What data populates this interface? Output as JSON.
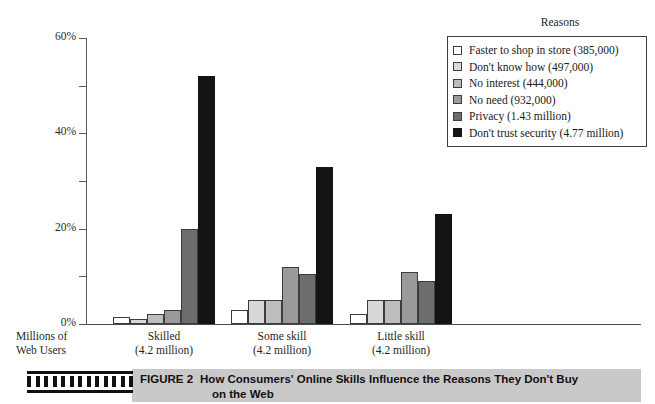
{
  "chart_data": {
    "type": "bar",
    "title": "How Consumers' Online Skills Influence the Reasons They Don't Buy on the Web",
    "xlabel": "Millions of Web Users",
    "ylabel": "",
    "ylim": [
      0,
      60
    ],
    "yticks": [
      "0%",
      "20%",
      "40%",
      "60%"
    ],
    "ytick_values": [
      0,
      20,
      40,
      60
    ],
    "minor_ticks": [
      10,
      30,
      50
    ],
    "grid": false,
    "legend_position": "top-right",
    "legend_title": "Reasons",
    "categories": [
      "Skilled",
      "Some skill",
      "Little skill"
    ],
    "category_sublabels": [
      "(4.2 million)",
      "(4.2 million)",
      "(4.2 million)"
    ],
    "series": [
      {
        "name": "Faster to shop in store (385,000)",
        "color": "#ffffff",
        "values": [
          1.5,
          3.0,
          2.0
        ]
      },
      {
        "name": "Don't know how (497,000)",
        "color": "#d8d8d8",
        "values": [
          1.0,
          5.0,
          5.0
        ]
      },
      {
        "name": "No interest (444,000)",
        "color": "#bdbdbd",
        "values": [
          2.0,
          5.0,
          5.0
        ]
      },
      {
        "name": "No need (932,000)",
        "color": "#9a9a9a",
        "values": [
          3.0,
          12.0,
          11.0
        ]
      },
      {
        "name": "Privacy (1.43 million)",
        "color": "#6d6d6d",
        "values": [
          20.0,
          10.5,
          9.0
        ]
      },
      {
        "name": "Don't trust security (4.77 million)",
        "color": "#141414",
        "values": [
          52.0,
          33.0,
          23.0
        ]
      }
    ]
  },
  "legend": {
    "title": "Reasons",
    "items": [
      {
        "label": "Faster to shop in store (385,000)"
      },
      {
        "label": "Don't know how (497,000)"
      },
      {
        "label": "No interest (444,000)"
      },
      {
        "label": "No need (932,000)"
      },
      {
        "label": "Privacy (1.43 million)"
      },
      {
        "label": "Don't trust security (4.77 million)"
      }
    ]
  },
  "axis": {
    "y_labels": [
      "60%",
      "40%",
      "20%",
      "0%"
    ],
    "x_caption_line1": "Millions of",
    "x_caption_line2": "Web Users"
  },
  "categories": [
    {
      "name": "Skilled",
      "sub": "(4.2 million)"
    },
    {
      "name": "Some skill",
      "sub": "(4.2 million)"
    },
    {
      "name": "Little skill",
      "sub": "(4.2 million)"
    }
  ],
  "caption": {
    "figure_number": "FIGURE 2",
    "line1": "How Consumers' Online Skills Influence the Reasons They Don't Buy",
    "line2": "on the Web"
  }
}
